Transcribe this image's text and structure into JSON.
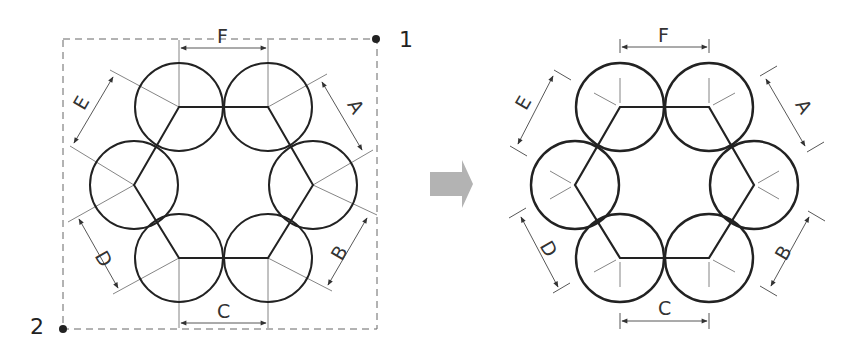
{
  "figure": {
    "left_panel": {
      "corner_labels": {
        "top_right": "1",
        "bottom_left": "2"
      },
      "dimension_labels": {
        "top": "F",
        "upper_right": "A",
        "lower_right": "B",
        "bottom": "C",
        "lower_left": "D",
        "upper_left": "E"
      }
    },
    "arrow": {
      "direction": "right",
      "color": "#b3b3b3"
    },
    "right_panel": {
      "dimension_labels": {
        "top": "F",
        "upper_right": "A",
        "lower_right": "B",
        "bottom": "C",
        "lower_left": "D",
        "upper_left": "E"
      }
    },
    "colors": {
      "stroke": "#222222",
      "thin": "#555555",
      "dashed": "#666666",
      "arrow": "#b3b3b3"
    }
  }
}
